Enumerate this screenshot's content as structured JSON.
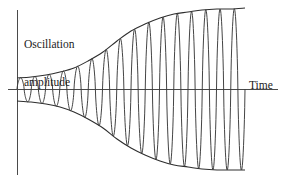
{
  "figure": {
    "title": "",
    "y_axis_label_line1": "Oscillation",
    "y_axis_label_line2": "amplitude",
    "x_axis_label": "Time",
    "background_color": "#ffffff",
    "line_color": "#3a3a3a",
    "axis_color": "#4a4a4a",
    "text_color": "#1c1c1c"
  },
  "chart_data": {
    "type": "line",
    "title": "",
    "subtitle": "",
    "xlabel": "Time",
    "ylabel": "Oscillation amplitude",
    "grid": false,
    "legend": null,
    "xlim": [
      0,
      16
    ],
    "ylim": [
      -1.05,
      1.05
    ],
    "axis_origin_px": {
      "x": 17,
      "y": 89
    },
    "x_axis_end_px": 278,
    "y_axis_top_px": 10,
    "y_axis_bottom_px": 175,
    "wave": {
      "cycles": 16,
      "period_px": 14.3,
      "start_px": 17,
      "end_px": 245,
      "waveform": "sine",
      "phase": "starts at zero rising"
    },
    "envelope": {
      "shape": "sigmoid",
      "initial_amplitude": 0.13,
      "final_amplitude": 0.95,
      "midpoint_cycle": 7.0,
      "steepness": 0.42,
      "upper_envelope_px": [
        {
          "x": 17,
          "y": 78
        },
        {
          "x": 31,
          "y": 77
        },
        {
          "x": 46,
          "y": 75
        },
        {
          "x": 60,
          "y": 72
        },
        {
          "x": 74,
          "y": 68
        },
        {
          "x": 88,
          "y": 61
        },
        {
          "x": 103,
          "y": 52
        },
        {
          "x": 117,
          "y": 41
        },
        {
          "x": 131,
          "y": 31
        },
        {
          "x": 145,
          "y": 24
        },
        {
          "x": 160,
          "y": 18
        },
        {
          "x": 174,
          "y": 14
        },
        {
          "x": 188,
          "y": 12
        },
        {
          "x": 202,
          "y": 10
        },
        {
          "x": 217,
          "y": 9
        },
        {
          "x": 231,
          "y": 9
        },
        {
          "x": 245,
          "y": 8
        }
      ],
      "lower_envelope_px": [
        {
          "x": 17,
          "y": 101
        },
        {
          "x": 31,
          "y": 102
        },
        {
          "x": 46,
          "y": 104
        },
        {
          "x": 60,
          "y": 107
        },
        {
          "x": 74,
          "y": 112
        },
        {
          "x": 88,
          "y": 119
        },
        {
          "x": 103,
          "y": 128
        },
        {
          "x": 117,
          "y": 139
        },
        {
          "x": 131,
          "y": 148
        },
        {
          "x": 145,
          "y": 155
        },
        {
          "x": 160,
          "y": 161
        },
        {
          "x": 174,
          "y": 165
        },
        {
          "x": 188,
          "y": 167
        },
        {
          "x": 202,
          "y": 169
        },
        {
          "x": 217,
          "y": 170
        },
        {
          "x": 231,
          "y": 170
        },
        {
          "x": 245,
          "y": 170
        }
      ],
      "amplitude_by_cycle": [
        0.13,
        0.14,
        0.16,
        0.19,
        0.24,
        0.32,
        0.43,
        0.56,
        0.68,
        0.78,
        0.86,
        0.9,
        0.93,
        0.94,
        0.95,
        0.95
      ]
    }
  }
}
